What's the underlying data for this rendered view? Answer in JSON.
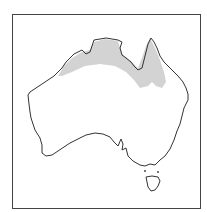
{
  "map": {
    "subject": "Australia",
    "colors": {
      "background": "#ffffff",
      "frame": "#444444",
      "coastline": "#333333",
      "shaded_region": "#d3d3d3"
    },
    "layers": [
      {
        "name": "frame"
      },
      {
        "name": "shaded-region-northern-australia"
      },
      {
        "name": "mainland-coastline"
      },
      {
        "name": "tasmania"
      }
    ]
  }
}
